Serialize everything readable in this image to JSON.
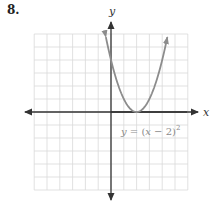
{
  "problem": {
    "number": "8."
  },
  "chart_data": {
    "type": "line",
    "title": "",
    "xlabel": "x",
    "ylabel": "y",
    "equation": "y = (x − 2)²",
    "equation_parts": {
      "lhs": "y",
      "eq": " = (",
      "var": "x",
      "rest": " − 2)",
      "exp": "2"
    },
    "xlim": [
      -6,
      6
    ],
    "ylim": [
      -6,
      6
    ],
    "grid": true,
    "grid_step": 1,
    "tick_labels": false,
    "vertex": [
      2,
      0
    ],
    "y_intercept": [
      0,
      4
    ],
    "series": [
      {
        "name": "y = (x − 2)²",
        "x": [
          -0.4,
          0,
          0.5,
          1,
          1.5,
          2,
          2.5,
          3,
          3.5,
          4,
          4.4
        ],
        "y": [
          5.76,
          4,
          2.25,
          1,
          0.25,
          0,
          0.25,
          1,
          2.25,
          4,
          5.76
        ],
        "color": "#8c8c8c",
        "arrows_at_ends": true
      }
    ],
    "colors": {
      "grid": "#d9d9d9",
      "axes": "#333333",
      "curve": "#8c8c8c"
    }
  }
}
